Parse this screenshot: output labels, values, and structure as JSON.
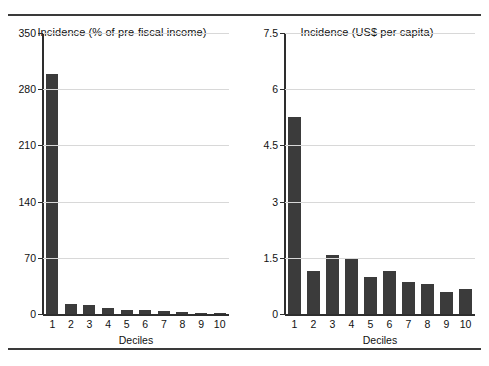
{
  "figure": {
    "background": "#ffffff",
    "bar_color": "#3b3b3b",
    "grid_color": "#d8d8d8",
    "axis_color": "#2e2e2e"
  },
  "chart_data": [
    {
      "type": "bar",
      "title": "Incidence (% of pre-fiscal income)",
      "xlabel": "Deciles",
      "ylabel": "",
      "categories": [
        "1",
        "2",
        "3",
        "4",
        "5",
        "6",
        "7",
        "8",
        "9",
        "10"
      ],
      "values": [
        299,
        12.5,
        11,
        8,
        5,
        5,
        3.7,
        2,
        1,
        0.8
      ],
      "ylim": [
        0,
        350
      ],
      "yticks": [
        0,
        70,
        140,
        210,
        280,
        350
      ],
      "ytick_labels": [
        "0",
        "70",
        "140",
        "210",
        "280",
        "350"
      ],
      "grid": true,
      "legend": "none"
    },
    {
      "type": "bar",
      "title": "Incidence (US$ per capita)",
      "xlabel": "Deciles",
      "ylabel": "",
      "categories": [
        "1",
        "2",
        "3",
        "4",
        "5",
        "6",
        "7",
        "8",
        "9",
        "10"
      ],
      "values": [
        5.25,
        1.15,
        1.57,
        1.48,
        0.98,
        1.15,
        0.85,
        0.8,
        0.6,
        0.68
      ],
      "ylim": [
        0,
        7.5
      ],
      "yticks": [
        0,
        1.5,
        3,
        4.5,
        6,
        7.5
      ],
      "ytick_labels": [
        "0",
        "1.5",
        "3",
        "4.5",
        "6",
        "7.5"
      ],
      "grid": true,
      "legend": "none"
    }
  ]
}
